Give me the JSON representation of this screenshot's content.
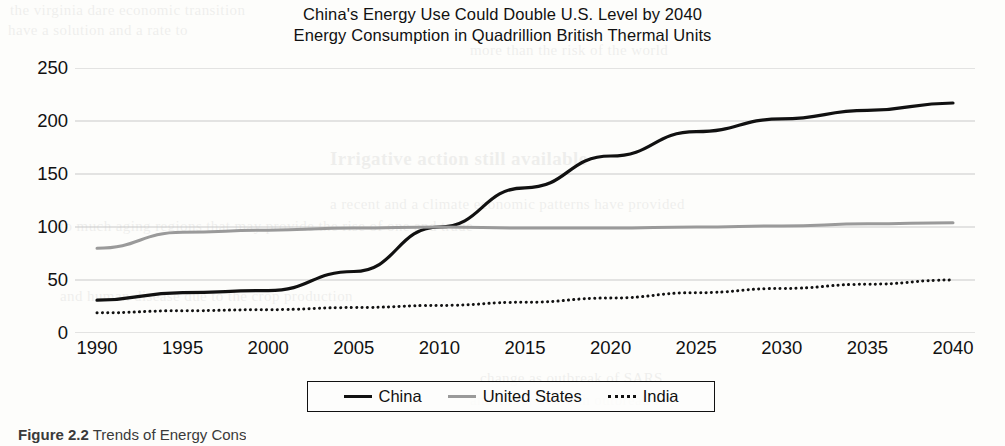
{
  "title": {
    "line1": "China's Energy Use Could Double U.S. Level by 2040",
    "line2": "Energy Consumption in Quadrillion British Thermal Units"
  },
  "legend": {
    "china": "China",
    "united_states": "United States",
    "india": "India"
  },
  "caption": {
    "label": "Figure 2.2",
    "text": "Trends of Energy Cons"
  },
  "colors": {
    "china": "#111111",
    "united_states": "#9a9a9a",
    "india": "#111111",
    "gridline": "#c9c9c9",
    "text": "#111111",
    "background": "#fdfdfb"
  },
  "ghost_text": [
    {
      "text": "the virginia dare economic transition",
      "x": 10,
      "y": 2,
      "size": 15,
      "bold": false
    },
    {
      "text": "have a solution and a rate to",
      "x": 8,
      "y": 22,
      "size": 15,
      "bold": false
    },
    {
      "text": "more than the risk of the world",
      "x": 470,
      "y": 42,
      "size": 15,
      "bold": false
    },
    {
      "text": "Irrigative action still available",
      "x": 330,
      "y": 148,
      "size": 19,
      "bold": true
    },
    {
      "text": "a recent and a climate economic patterns have provided",
      "x": 330,
      "y": 196,
      "size": 15,
      "bold": false
    },
    {
      "text": "to much aging regions that may provide the rise of one and trade",
      "x": 60,
      "y": 218,
      "size": 15,
      "bold": false
    },
    {
      "text": "and human disease due to the crop production",
      "x": 60,
      "y": 288,
      "size": 15,
      "bold": false
    },
    {
      "text": "change as outbreak of SARS",
      "x": 480,
      "y": 370,
      "size": 15,
      "bold": false
    },
    {
      "text": "and 1996, 100% th outbreak to",
      "x": 470,
      "y": 392,
      "size": 15,
      "bold": false
    }
  ],
  "chart_data": {
    "type": "line",
    "title": "China's Energy Use Could Double U.S. Level by 2040",
    "subtitle": "Energy Consumption in Quadrillion British Thermal Units",
    "xlabel": "",
    "ylabel": "",
    "ylim": [
      0,
      250
    ],
    "yticks": [
      0,
      50,
      100,
      150,
      200,
      250
    ],
    "grid": true,
    "legend_position": "bottom",
    "categories": [
      1990,
      1995,
      2000,
      2005,
      2010,
      2015,
      2020,
      2025,
      2030,
      2035,
      2040
    ],
    "series": [
      {
        "name": "China",
        "style": "solid",
        "color": "#111111",
        "width": 3.2,
        "values": [
          31,
          38,
          40,
          58,
          100,
          137,
          167,
          190,
          202,
          210,
          217
        ]
      },
      {
        "name": "United States",
        "style": "solid",
        "color": "#9a9a9a",
        "width": 3.0,
        "values": [
          80,
          95,
          97,
          99,
          100,
          99,
          99,
          100,
          101,
          103,
          104
        ]
      },
      {
        "name": "India",
        "style": "dotted",
        "color": "#111111",
        "width": 3.0,
        "values": [
          19,
          21,
          22,
          24,
          26,
          29,
          33,
          38,
          42,
          46,
          50
        ]
      }
    ]
  }
}
